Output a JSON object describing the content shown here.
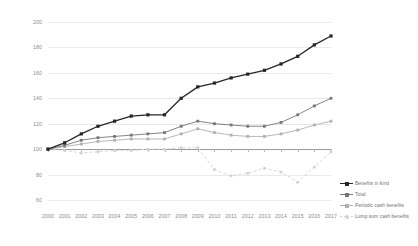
{
  "chart_data": {
    "type": "line",
    "title": "",
    "subtitle": "",
    "xlabel": "",
    "ylabel": "",
    "index_base": "2000 = 100",
    "grid": true,
    "legend_position": "right",
    "ylim": [
      60,
      200
    ],
    "yticks": [
      200,
      180,
      160,
      140,
      120,
      100,
      80,
      60
    ],
    "categories": [
      "2000",
      "2001",
      "2002",
      "2003",
      "2004",
      "2005",
      "2006",
      "2007",
      "2008",
      "2009",
      "2010",
      "2011",
      "2012",
      "2013",
      "2014",
      "2015",
      "2016",
      "2017"
    ],
    "x": [
      2000,
      2001,
      2002,
      2003,
      2004,
      2005,
      2006,
      2007,
      2008,
      2009,
      2010,
      2011,
      2012,
      2013,
      2014,
      2015,
      2016,
      2017
    ],
    "series": [
      {
        "name": "Benefits in kind",
        "color": "#262626",
        "marker": "square",
        "dash": "none",
        "values": [
          100,
          105,
          112,
          118,
          122,
          126,
          127,
          127,
          140,
          149,
          152,
          156,
          159,
          162,
          167,
          173,
          182,
          189
        ]
      },
      {
        "name": "Total",
        "color": "#767676",
        "marker": "square",
        "dash": "none",
        "values": [
          100,
          103,
          107,
          109,
          110,
          111,
          112,
          113,
          118,
          122,
          120,
          119,
          118,
          118,
          121,
          127,
          134,
          140
        ]
      },
      {
        "name": "Periodic cash benefits",
        "color": "#b0b0b0",
        "marker": "square",
        "dash": "none",
        "values": [
          100,
          102,
          104,
          106,
          107,
          108,
          108,
          108,
          112,
          116,
          113,
          111,
          110,
          110,
          112,
          115,
          119,
          122
        ]
      },
      {
        "name": "Lump sum cash benefits",
        "color": "#d2d2d2",
        "marker": "circle",
        "dash": "dashed",
        "values": [
          100,
          99,
          97,
          98,
          99,
          99,
          100,
          100,
          101,
          101,
          84,
          79,
          81,
          85,
          82,
          74,
          86,
          98
        ]
      }
    ]
  },
  "legend": {
    "items": [
      {
        "label": "Benefits in kind"
      },
      {
        "label": "Total"
      },
      {
        "label": "Periodic cash benefits"
      },
      {
        "label": "Lump sum cash benefits"
      }
    ]
  }
}
